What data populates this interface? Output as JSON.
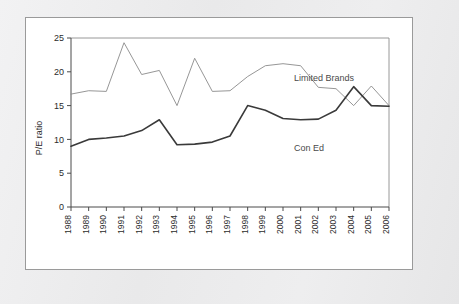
{
  "figure": {
    "panel_background": "#ffffff",
    "page_background": "#ececed"
  },
  "chart_data": {
    "type": "line",
    "title": "",
    "subtitle": "",
    "xlabel": "",
    "ylabel": "P/E ratio",
    "xlim": [
      1988,
      2006
    ],
    "ylim": [
      0,
      25
    ],
    "ytick_values": [
      0,
      5,
      10,
      15,
      20,
      25
    ],
    "ytick_labels": [
      "0",
      "5",
      "10",
      "15",
      "20",
      "25"
    ],
    "grid": false,
    "legend_position": "inline-annotation",
    "categories": [
      "1988",
      "1989",
      "1990",
      "1991",
      "1992",
      "1993",
      "1994",
      "1995",
      "1996",
      "1997",
      "1998",
      "1999",
      "2000",
      "2001",
      "2002",
      "2003",
      "2004",
      "2005",
      "2006"
    ],
    "x": [
      1988,
      1989,
      1990,
      1991,
      1992,
      1993,
      1994,
      1995,
      1996,
      1997,
      1998,
      1999,
      2000,
      2001,
      2002,
      2003,
      2004,
      2005,
      2006
    ],
    "series": [
      {
        "name": "Limited Brands",
        "color": "#8a8a8a",
        "line_width": 0.9,
        "values": [
          16.7,
          17.2,
          17.1,
          24.3,
          19.6,
          20.2,
          15.0,
          22.0,
          17.1,
          17.2,
          19.3,
          20.9,
          21.2,
          20.9,
          17.7,
          17.5,
          15.0,
          17.9,
          15.0
        ]
      },
      {
        "name": "Con Ed",
        "color": "#3a3a3a",
        "line_width": 1.6,
        "values": [
          9.0,
          10.0,
          10.2,
          10.5,
          11.3,
          12.9,
          9.2,
          9.3,
          9.6,
          10.5,
          15.0,
          14.3,
          13.1,
          12.9,
          13.0,
          14.3,
          17.8,
          15.0,
          14.9
        ]
      }
    ],
    "annotations": [
      {
        "text": "Limited Brands",
        "x_px": 268,
        "y_px": 63,
        "series": "Limited Brands"
      },
      {
        "text": "Con Ed",
        "x_px": 268,
        "y_px": 133,
        "series": "Con Ed"
      }
    ]
  }
}
